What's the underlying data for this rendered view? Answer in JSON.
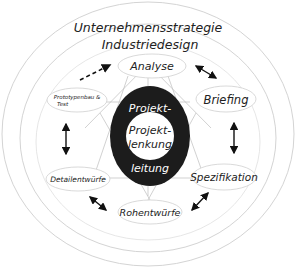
{
  "diagram": {
    "rings": {
      "outer": "Unternehmensstrategie",
      "inner": "Industriedesign"
    },
    "center": {
      "top": "Projekt-",
      "core_line1": "Projekt-",
      "core_line2": "lenkung",
      "bottom": "leitung"
    },
    "nodes": {
      "analyse": "Analyse",
      "briefing": "Briefing",
      "spezifikation": "Spezifikation",
      "rohentwuerfe": "Rohentwürfe",
      "detailentwuerfe": "Detailentwürfe",
      "prototypenbau_line1": "Prototypenbau &",
      "prototypenbau_line2": "Test"
    },
    "arrows": [
      {
        "from": "Prototypenbau & Test",
        "to": "Analyse",
        "style": "dashed"
      },
      {
        "from": "Analyse",
        "to": "Briefing",
        "style": "double"
      },
      {
        "from": "Briefing",
        "to": "Spezifikation",
        "style": "double"
      },
      {
        "from": "Spezifikation",
        "to": "Rohentwürfe",
        "style": "double"
      },
      {
        "from": "Rohentwürfe",
        "to": "Detailentwürfe",
        "style": "double"
      },
      {
        "from": "Detailentwürfe",
        "to": "Prototypenbau & Test",
        "style": "double"
      }
    ],
    "colors": {
      "core_dark": "#1c1c1c",
      "ring_line": "#cfcfcf",
      "text": "#222222"
    }
  }
}
